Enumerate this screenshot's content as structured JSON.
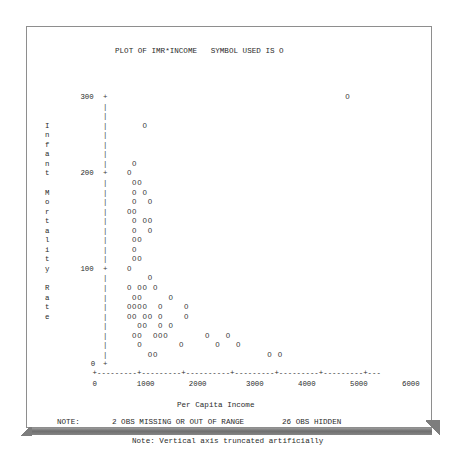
{
  "page": {
    "title": "PLOT OF IMR*INCOME   SYMBOL USED IS O",
    "plot_symbol": "O",
    "vertical_axis_label_chars": [
      "I",
      "n",
      "f",
      "a",
      "n",
      "t",
      "",
      "M",
      "o",
      "r",
      "t",
      "a",
      "l",
      "i",
      "t",
      "y",
      "",
      "R",
      "a",
      "t",
      "e"
    ],
    "vertical_axis_label": "Infant Mortality Rate",
    "xlabel": "Per Capita Income",
    "note_prefix": "NOTE:",
    "note_missing": "2 OBS MISSING OR OUT OF RANGE",
    "note_hidden": "26 OBS HIDDEN",
    "note_truncated": "Note: Vertical axis truncated artificially",
    "axis_tick_char": "+",
    "axis_vline_char": "|",
    "axis_hline_char": "-"
  },
  "chart_data": {
    "type": "scatter",
    "title": "PLOT OF IMR*INCOME   SYMBOL USED IS O",
    "xlabel": "Per Capita Income",
    "ylabel": "Infant Mortality Rate",
    "symbol": "O",
    "xlim": [
      0,
      6250
    ],
    "ylim": [
      0,
      300
    ],
    "xticks": [
      0,
      1000,
      2000,
      3000,
      4000,
      5000,
      6000
    ],
    "xtick_labels": [
      "0",
      "1000",
      "2000",
      "3000",
      "4000",
      "5000",
      "6000"
    ],
    "yticks": [
      0,
      100,
      200,
      300
    ],
    "ytick_labels": [
      "0",
      "100",
      "200",
      "300"
    ],
    "grid": false,
    "legend": null,
    "obs_missing_or_out_of_range": 2,
    "obs_hidden": 26,
    "annotations": [
      "NOTE:   2 OBS MISSING OR OUT OF RANGE   26 OBS HIDDEN",
      "Note: Vertical axis truncated artificially"
    ],
    "points": [
      {
        "x": 2570,
        "y": 300
      },
      {
        "x": 330,
        "y": 262
      },
      {
        "x": 210,
        "y": 216
      },
      {
        "x": 130,
        "y": 200
      },
      {
        "x": 165,
        "y": 194
      },
      {
        "x": 260,
        "y": 194
      },
      {
        "x": 160,
        "y": 186
      },
      {
        "x": 350,
        "y": 186
      },
      {
        "x": 160,
        "y": 178
      },
      {
        "x": 440,
        "y": 178
      },
      {
        "x": 160,
        "y": 170
      },
      {
        "x": 250,
        "y": 170
      },
      {
        "x": 155,
        "y": 162
      },
      {
        "x": 395,
        "y": 162
      },
      {
        "x": 480,
        "y": 162
      },
      {
        "x": 155,
        "y": 154
      },
      {
        "x": 420,
        "y": 154
      },
      {
        "x": 160,
        "y": 146
      },
      {
        "x": 250,
        "y": 146
      },
      {
        "x": 150,
        "y": 138
      },
      {
        "x": 160,
        "y": 130
      },
      {
        "x": 250,
        "y": 130
      },
      {
        "x": 140,
        "y": 100
      },
      {
        "x": 560,
        "y": 92
      },
      {
        "x": 140,
        "y": 84
      },
      {
        "x": 330,
        "y": 84
      },
      {
        "x": 420,
        "y": 84
      },
      {
        "x": 610,
        "y": 84
      },
      {
        "x": 230,
        "y": 76
      },
      {
        "x": 310,
        "y": 76
      },
      {
        "x": 1060,
        "y": 76
      },
      {
        "x": 140,
        "y": 68
      },
      {
        "x": 230,
        "y": 68
      },
      {
        "x": 310,
        "y": 68
      },
      {
        "x": 395,
        "y": 68
      },
      {
        "x": 690,
        "y": 68
      },
      {
        "x": 1270,
        "y": 68
      },
      {
        "x": 140,
        "y": 60
      },
      {
        "x": 230,
        "y": 60
      },
      {
        "x": 400,
        "y": 60
      },
      {
        "x": 480,
        "y": 60
      },
      {
        "x": 690,
        "y": 60
      },
      {
        "x": 1270,
        "y": 60
      },
      {
        "x": 290,
        "y": 52
      },
      {
        "x": 370,
        "y": 52
      },
      {
        "x": 690,
        "y": 52
      },
      {
        "x": 860,
        "y": 52
      },
      {
        "x": 250,
        "y": 44
      },
      {
        "x": 330,
        "y": 44
      },
      {
        "x": 560,
        "y": 44
      },
      {
        "x": 645,
        "y": 44
      },
      {
        "x": 730,
        "y": 44
      },
      {
        "x": 1760,
        "y": 44
      },
      {
        "x": 2190,
        "y": 44
      },
      {
        "x": 290,
        "y": 36
      },
      {
        "x": 1190,
        "y": 36
      },
      {
        "x": 1930,
        "y": 36
      },
      {
        "x": 2360,
        "y": 36
      },
      {
        "x": 440,
        "y": 28
      },
      {
        "x": 520,
        "y": 28
      },
      {
        "x": 2940,
        "y": 28
      },
      {
        "x": 3110,
        "y": 28
      }
    ],
    "grid_plot": {
      "comment": "Character-cell representation as rendered by PROC PLOT. Each entry is {row, col} into the plot character grid; col 0 is the axis line.",
      "rows": [
        {
          "row": 0,
          "label": "300",
          "tick": true,
          "cols": [
            45
          ]
        },
        {
          "row": 1,
          "label": "",
          "tick": false,
          "cols": []
        },
        {
          "row": 2,
          "label": "",
          "tick": false,
          "cols": []
        },
        {
          "row": 3,
          "label": "",
          "tick": false,
          "cols": [
            6
          ]
        },
        {
          "row": 4,
          "label": "",
          "tick": false,
          "cols": []
        },
        {
          "row": 5,
          "label": "",
          "tick": false,
          "cols": []
        },
        {
          "row": 6,
          "label": "",
          "tick": false,
          "cols": []
        },
        {
          "row": 7,
          "label": "",
          "tick": false,
          "cols": [
            4
          ]
        },
        {
          "row": 8,
          "label": "200",
          "tick": true,
          "cols": [
            3
          ]
        },
        {
          "row": 9,
          "label": "",
          "tick": false,
          "cols": [
            4,
            5
          ]
        },
        {
          "row": 10,
          "label": "",
          "tick": false,
          "cols": [
            4,
            6
          ]
        },
        {
          "row": 11,
          "label": "",
          "tick": false,
          "cols": [
            4,
            7
          ]
        },
        {
          "row": 12,
          "label": "",
          "tick": false,
          "cols": [
            3,
            4
          ]
        },
        {
          "row": 13,
          "label": "",
          "tick": false,
          "cols": [
            4,
            6,
            7
          ]
        },
        {
          "row": 14,
          "label": "",
          "tick": false,
          "cols": [
            4,
            7
          ]
        },
        {
          "row": 15,
          "label": "",
          "tick": false,
          "cols": [
            4,
            5
          ]
        },
        {
          "row": 16,
          "label": "",
          "tick": false,
          "cols": [
            4
          ]
        },
        {
          "row": 17,
          "label": "",
          "tick": false,
          "cols": [
            4,
            5
          ]
        },
        {
          "row": 18,
          "label": "100",
          "tick": true,
          "cols": [
            3
          ]
        },
        {
          "row": 19,
          "label": "",
          "tick": false,
          "cols": [
            7
          ]
        },
        {
          "row": 20,
          "label": "",
          "tick": false,
          "cols": [
            3,
            5,
            6,
            8
          ]
        },
        {
          "row": 21,
          "label": "",
          "tick": false,
          "cols": [
            4,
            5,
            11
          ]
        },
        {
          "row": 22,
          "label": "",
          "tick": false,
          "cols": [
            3,
            4,
            5,
            6,
            9,
            14
          ]
        },
        {
          "row": 23,
          "label": "",
          "tick": false,
          "cols": [
            3,
            4,
            6,
            7,
            9,
            14
          ]
        },
        {
          "row": 24,
          "label": "",
          "tick": false,
          "cols": [
            5,
            6,
            9,
            11
          ]
        },
        {
          "row": 25,
          "label": "",
          "tick": false,
          "cols": [
            4,
            5,
            8,
            9,
            10,
            18,
            22
          ]
        },
        {
          "row": 26,
          "label": "",
          "tick": false,
          "cols": [
            5,
            13,
            20,
            24
          ]
        },
        {
          "row": 27,
          "label": "",
          "tick": false,
          "cols": [
            7,
            8,
            30,
            32
          ]
        },
        {
          "row": 28,
          "label": "0",
          "tick": true,
          "cols": []
        }
      ]
    }
  },
  "layout": {
    "char_w": 5.2,
    "char_h": 9.55,
    "plot_origin_x": 76,
    "plot_origin_y": 66,
    "axis_col": 0
  }
}
